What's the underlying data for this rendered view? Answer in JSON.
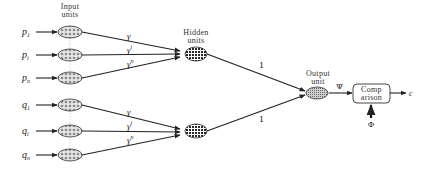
{
  "diagram": {
    "headings": {
      "input": [
        "Input",
        "units"
      ],
      "hidden": [
        "Hidden",
        "units"
      ],
      "output": [
        "Output",
        "unit"
      ]
    },
    "inputs": [
      {
        "base": "p",
        "sub": "1",
        "y": 32
      },
      {
        "base": "p",
        "sub": "i",
        "y": 55
      },
      {
        "base": "p",
        "sub": "n",
        "y": 78
      },
      {
        "base": "q",
        "sub": "1",
        "y": 105
      },
      {
        "base": "q",
        "sub": "i",
        "y": 131
      },
      {
        "base": "q",
        "sub": "n",
        "y": 155
      }
    ],
    "weights": [
      {
        "base": "γ",
        "sup": ""
      },
      {
        "base": "γ",
        "sup": "i"
      },
      {
        "base": "γ",
        "sup": "n"
      },
      {
        "base": "γ",
        "sup": ""
      },
      {
        "base": "γ",
        "sup": "i"
      },
      {
        "base": "γ",
        "sup": "n"
      }
    ],
    "hidden_to_output_weights": [
      "1",
      "1"
    ],
    "output_signal": "Ψ",
    "comparison_label": [
      "Comp",
      "arison"
    ],
    "target_signal": "Φ",
    "result": "c",
    "colors": {
      "line": "#222222",
      "node_fill": "#bdbdbd",
      "hidden_fill": "#444444",
      "output_fill": "#9a9a9a"
    }
  }
}
